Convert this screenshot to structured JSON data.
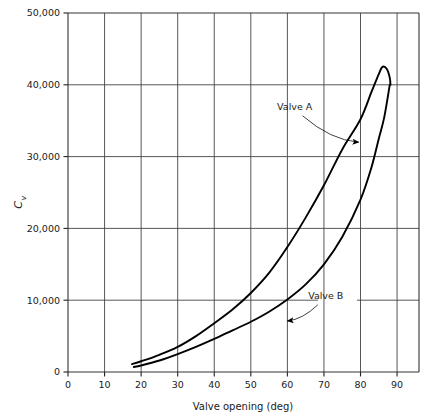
{
  "chart_data": {
    "type": "line",
    "title": "",
    "xlabel": "Valve opening (deg)",
    "ylabel": "C",
    "ylabel_subscript": "v",
    "xlim": [
      0,
      96
    ],
    "ylim": [
      0,
      50000
    ],
    "grid": true,
    "legend_position": "inline-annotations",
    "xticks": [
      0,
      10,
      20,
      30,
      40,
      50,
      60,
      70,
      80,
      90
    ],
    "xtick_labels": [
      "0",
      "10",
      "20",
      "30",
      "40",
      "50",
      "60",
      "70",
      "80",
      "90"
    ],
    "yticks": [
      0,
      10000,
      20000,
      30000,
      40000,
      50000
    ],
    "ytick_labels": [
      "0",
      "10,000",
      "20,000",
      "30,000",
      "40,000",
      "50,000"
    ],
    "series": [
      {
        "name": "Valve A",
        "color": "#000000",
        "note": "rises steeply, peaks near 86 deg at 42,500 then loops back down to 40,000 at 88 deg",
        "points": [
          [
            17.5,
            1100
          ],
          [
            20,
            1500
          ],
          [
            25,
            2400
          ],
          [
            30,
            3500
          ],
          [
            35,
            5000
          ],
          [
            40,
            6800
          ],
          [
            45,
            8700
          ],
          [
            50,
            11000
          ],
          [
            55,
            13800
          ],
          [
            60,
            17400
          ],
          [
            65,
            21500
          ],
          [
            70,
            26000
          ],
          [
            75,
            31000
          ],
          [
            80,
            35200
          ],
          [
            83,
            39000
          ],
          [
            85,
            41500
          ],
          [
            86,
            42500
          ],
          [
            87.2,
            42200
          ],
          [
            88,
            41000
          ],
          [
            88.2,
            40000
          ]
        ]
      },
      {
        "name": "Valve B",
        "color": "#000000",
        "note": "lower curve, rises monotonically to about 40,000 at 88 deg",
        "points": [
          [
            18,
            700
          ],
          [
            20,
            900
          ],
          [
            25,
            1600
          ],
          [
            30,
            2500
          ],
          [
            35,
            3500
          ],
          [
            40,
            4600
          ],
          [
            45,
            5800
          ],
          [
            50,
            7000
          ],
          [
            55,
            8400
          ],
          [
            60,
            10100
          ],
          [
            65,
            12200
          ],
          [
            70,
            15000
          ],
          [
            75,
            18800
          ],
          [
            80,
            24000
          ],
          [
            83,
            28500
          ],
          [
            85,
            32500
          ],
          [
            86.5,
            35500
          ],
          [
            88,
            40000
          ]
        ]
      }
    ],
    "annotations": [
      {
        "name": "Valve A",
        "label": "Valve A",
        "label_x": 62.0,
        "label_y": 36500,
        "target_x": 79.5,
        "target_y": 32000
      },
      {
        "name": "Valve B",
        "label": "Valve B",
        "label_x": 70.5,
        "label_y": 10200,
        "target_x": 60.0,
        "target_y": 7100
      }
    ]
  }
}
